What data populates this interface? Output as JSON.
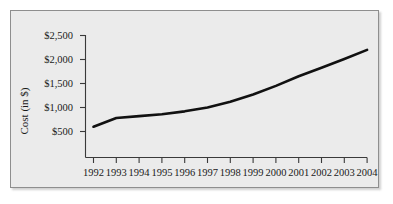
{
  "chart_data": {
    "type": "line",
    "title": "",
    "xlabel": "",
    "ylabel": "Cost (in $)",
    "categories": [
      "1992",
      "1993",
      "1994",
      "1995",
      "1996",
      "1997",
      "1998",
      "1999",
      "2000",
      "2001",
      "2002",
      "2003",
      "2004"
    ],
    "values": [
      600,
      780,
      820,
      860,
      920,
      1000,
      1120,
      1270,
      1450,
      1650,
      1830,
      2010,
      2200
    ],
    "series": [
      {
        "name": "Cost",
        "values": [
          600,
          780,
          820,
          860,
          920,
          1000,
          1120,
          1270,
          1450,
          1650,
          1830,
          2010,
          2200
        ]
      }
    ],
    "ylim": [
      250,
      2500
    ],
    "xlim": [
      "1992",
      "2004"
    ],
    "y_ticks": [
      500,
      1000,
      1500,
      2000,
      2500
    ],
    "y_tick_labels": [
      "$500",
      "$1,000",
      "$1,500",
      "$2,000",
      "$2,500"
    ],
    "x_tick_labels": [
      "1992",
      "1993",
      "1994",
      "1995",
      "1996",
      "1997",
      "1998",
      "1999",
      "2000",
      "2001",
      "2002",
      "2003",
      "2004"
    ],
    "grid": false,
    "legend": false,
    "legend_position": "none",
    "line_color": "#111111",
    "background_color": "#ebebeb",
    "axis_color": "#3a3a3a"
  },
  "axis": {
    "y_label": "Cost (in $)",
    "y_tick_labels": [
      "$2,500",
      "$2,000",
      "$1,500",
      "$1,000",
      "$500"
    ],
    "x_tick_labels": [
      "1992",
      "1993",
      "1994",
      "1995",
      "1996",
      "1997",
      "1998",
      "1999",
      "2000",
      "2001",
      "2002",
      "2003",
      "2004"
    ]
  }
}
